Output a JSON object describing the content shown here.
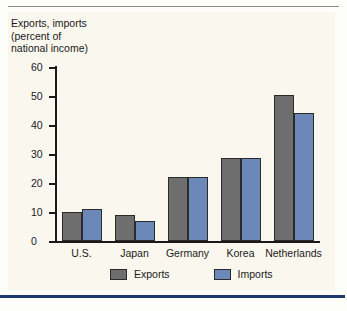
{
  "chart_data": {
    "type": "bar",
    "title": "Exports, imports\n(percent of\nnational income)",
    "xlabel": "",
    "ylabel": "",
    "ylim": [
      0,
      60
    ],
    "ytick_step": 10,
    "yticks": [
      "0",
      "10",
      "20",
      "30",
      "40",
      "50",
      "60"
    ],
    "grid": false,
    "legend_position": "bottom",
    "categories": [
      "U.S.",
      "Japan",
      "Germany",
      "Korea",
      "Netherlands"
    ],
    "series": [
      {
        "name": "Exports",
        "color": "#6e6e6e",
        "values": [
          10,
          9,
          22,
          28.5,
          50.5
        ]
      },
      {
        "name": "Imports",
        "color": "#6b88b8",
        "values": [
          11,
          7,
          22,
          28.5,
          44
        ]
      }
    ]
  },
  "legend": {
    "items": [
      {
        "label": "Exports"
      },
      {
        "label": "Imports"
      }
    ]
  },
  "colors": {
    "panel_background": "#faf7ef",
    "exports_bar": "#6e6e6e",
    "imports_bar": "#6b88b8",
    "bottom_rule": "#1d3a6e",
    "top_rule": "#8b8b86",
    "axis": "#1a1a1a"
  }
}
